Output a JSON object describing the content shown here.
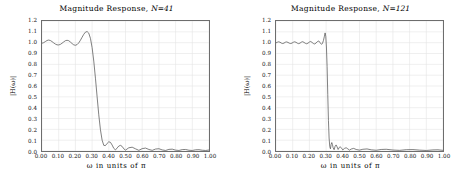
{
  "figure": {
    "background": "#ffffff",
    "axis_color": "#6d6d6d",
    "grid_color": "#e3e3e3",
    "curve_color": "#4a4a4a"
  },
  "chart_data": [
    {
      "type": "line",
      "title": "Magnitude Response, N=41",
      "title_prefix": "Magnitude Response, ",
      "title_param": "N=41",
      "xlabel": "ω in units of π",
      "ylabel": "|H(ω)|",
      "xlim": [
        0.0,
        1.0
      ],
      "ylim": [
        0.0,
        1.2
      ],
      "grid": true,
      "legend": "none",
      "xticks": [
        "0.00",
        "0.10",
        "0.20",
        "0.30",
        "0.40",
        "0.50",
        "0.60",
        "0.70",
        "0.80",
        "0.90",
        "1.00"
      ],
      "xtick_values": [
        0.0,
        0.1,
        0.2,
        0.3,
        0.4,
        0.5,
        0.6,
        0.7,
        0.8,
        0.9,
        1.0
      ],
      "yticks": [
        "0.0",
        "0.1",
        "0.2",
        "0.3",
        "0.4",
        "0.5",
        "0.6",
        "0.7",
        "0.8",
        "0.9",
        "1.0",
        "1.1",
        "1.2"
      ],
      "ytick_values": [
        0.0,
        0.1,
        0.2,
        0.3,
        0.4,
        0.5,
        0.6,
        0.7,
        0.8,
        0.9,
        1.0,
        1.1,
        1.2
      ],
      "x": [
        0.0,
        0.01,
        0.02,
        0.03,
        0.04,
        0.05,
        0.06,
        0.07,
        0.08,
        0.09,
        0.1,
        0.11,
        0.12,
        0.13,
        0.14,
        0.15,
        0.16,
        0.17,
        0.18,
        0.19,
        0.2,
        0.21,
        0.22,
        0.23,
        0.24,
        0.25,
        0.26,
        0.27,
        0.28,
        0.29,
        0.3,
        0.31,
        0.32,
        0.33,
        0.34,
        0.35,
        0.36,
        0.37,
        0.38,
        0.39,
        0.4,
        0.41,
        0.42,
        0.43,
        0.44,
        0.45,
        0.46,
        0.47,
        0.48,
        0.49,
        0.5,
        0.52,
        0.54,
        0.56,
        0.58,
        0.6,
        0.62,
        0.64,
        0.66,
        0.68,
        0.7,
        0.72,
        0.74,
        0.76,
        0.78,
        0.8,
        0.82,
        0.84,
        0.86,
        0.88,
        0.9,
        0.92,
        0.94,
        0.96,
        0.98,
        1.0
      ],
      "y": [
        0.995,
        1.0,
        1.01,
        1.02,
        1.024,
        1.02,
        1.01,
        0.998,
        0.987,
        0.98,
        0.979,
        0.984,
        0.995,
        1.007,
        1.018,
        1.022,
        1.018,
        1.006,
        0.992,
        0.98,
        0.976,
        0.982,
        0.998,
        1.022,
        1.05,
        1.077,
        1.097,
        1.103,
        1.088,
        1.04,
        0.955,
        0.83,
        0.672,
        0.5,
        0.334,
        0.196,
        0.1,
        0.052,
        0.05,
        0.07,
        0.085,
        0.08,
        0.055,
        0.024,
        0.01,
        0.028,
        0.046,
        0.052,
        0.042,
        0.02,
        0.008,
        0.03,
        0.035,
        0.02,
        0.006,
        0.022,
        0.027,
        0.014,
        0.006,
        0.018,
        0.021,
        0.01,
        0.005,
        0.015,
        0.017,
        0.008,
        0.005,
        0.013,
        0.014,
        0.007,
        0.005,
        0.011,
        0.012,
        0.007,
        0.005,
        0.009
      ]
    },
    {
      "type": "line",
      "title": "Magnitude Response, N=121",
      "title_prefix": "Magnitude Response, ",
      "title_param": "N=121",
      "xlabel": "ω in units of π",
      "ylabel": "|H(ω)|",
      "xlim": [
        0.0,
        1.0
      ],
      "ylim": [
        0.0,
        1.2
      ],
      "grid": true,
      "legend": "none",
      "xticks": [
        "0.00",
        "0.10",
        "0.20",
        "0.30",
        "0.40",
        "0.50",
        "0.60",
        "0.70",
        "0.80",
        "0.90",
        "1.00"
      ],
      "xtick_values": [
        0.0,
        0.1,
        0.2,
        0.3,
        0.4,
        0.5,
        0.6,
        0.7,
        0.8,
        0.9,
        1.0
      ],
      "yticks": [
        "0.0",
        "0.1",
        "0.2",
        "0.3",
        "0.4",
        "0.5",
        "0.6",
        "0.7",
        "0.8",
        "0.9",
        "1.0",
        "1.1",
        "1.2"
      ],
      "ytick_values": [
        0.0,
        0.1,
        0.2,
        0.3,
        0.4,
        0.5,
        0.6,
        0.7,
        0.8,
        0.9,
        1.0,
        1.1,
        1.2
      ],
      "x": [
        0.0,
        0.008,
        0.016,
        0.024,
        0.032,
        0.04,
        0.048,
        0.056,
        0.064,
        0.072,
        0.08,
        0.088,
        0.096,
        0.104,
        0.112,
        0.12,
        0.128,
        0.136,
        0.144,
        0.152,
        0.16,
        0.168,
        0.176,
        0.184,
        0.192,
        0.2,
        0.208,
        0.216,
        0.224,
        0.232,
        0.24,
        0.248,
        0.256,
        0.264,
        0.272,
        0.278,
        0.284,
        0.29,
        0.294,
        0.298,
        0.302,
        0.306,
        0.31,
        0.314,
        0.318,
        0.322,
        0.326,
        0.33,
        0.334,
        0.338,
        0.342,
        0.348,
        0.354,
        0.36,
        0.366,
        0.372,
        0.378,
        0.384,
        0.392,
        0.4,
        0.41,
        0.42,
        0.43,
        0.44,
        0.45,
        0.465,
        0.48,
        0.5,
        0.52,
        0.545,
        0.57,
        0.6,
        0.63,
        0.66,
        0.7,
        0.74,
        0.78,
        0.82,
        0.86,
        0.9,
        0.94,
        0.97,
        1.0
      ],
      "y": [
        0.998,
        1.004,
        1.008,
        1.004,
        0.996,
        0.992,
        0.996,
        1.004,
        1.007,
        1.002,
        0.995,
        0.992,
        0.996,
        1.004,
        1.008,
        1.003,
        0.995,
        0.991,
        0.996,
        1.005,
        1.009,
        1.002,
        0.994,
        0.99,
        0.996,
        1.006,
        1.011,
        1.002,
        0.992,
        0.988,
        0.997,
        1.01,
        1.016,
        1.0,
        0.985,
        0.992,
        1.02,
        1.06,
        1.09,
        1.06,
        0.96,
        0.78,
        0.52,
        0.28,
        0.12,
        0.04,
        0.02,
        0.06,
        0.078,
        0.06,
        0.03,
        0.012,
        0.044,
        0.056,
        0.038,
        0.014,
        0.03,
        0.04,
        0.026,
        0.01,
        0.024,
        0.03,
        0.02,
        0.008,
        0.018,
        0.024,
        0.014,
        0.008,
        0.016,
        0.019,
        0.011,
        0.007,
        0.014,
        0.016,
        0.009,
        0.006,
        0.012,
        0.013,
        0.008,
        0.005,
        0.01,
        0.011,
        0.006
      ]
    }
  ]
}
